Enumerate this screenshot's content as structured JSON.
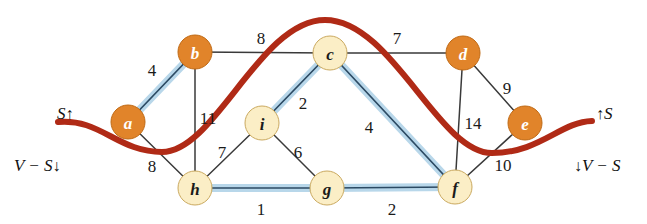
{
  "figure": {
    "width": 647,
    "height": 224,
    "background": "#ffffff"
  },
  "colors": {
    "node_dark_fill": "#e1842a",
    "node_light_fill": "#fbeec6",
    "cut_curve": "#b02a16",
    "mst_highlight": "#b8d7ea",
    "edge_stroke": "#3a3a3a"
  },
  "labels": {
    "left_top": {
      "set": "S",
      "arrow": "↑"
    },
    "left_bottom": {
      "set": "V − S",
      "arrow": "↓"
    },
    "right_top": {
      "arrow": "↑",
      "set": "S"
    },
    "right_bottom": {
      "arrow": "↓",
      "set": "V − S"
    }
  },
  "chart_data": {
    "type": "diagram",
    "title": "",
    "nodes": [
      {
        "id": "a",
        "label": "a",
        "x": 128,
        "y": 122,
        "r": 17,
        "side": "S",
        "shade": "dark"
      },
      {
        "id": "b",
        "label": "b",
        "x": 195,
        "y": 52,
        "r": 17,
        "side": "S",
        "shade": "dark"
      },
      {
        "id": "c",
        "label": "c",
        "x": 330,
        "y": 53,
        "r": 17,
        "side": "V-S",
        "shade": "light"
      },
      {
        "id": "d",
        "label": "d",
        "x": 463,
        "y": 53,
        "r": 17,
        "side": "S",
        "shade": "dark"
      },
      {
        "id": "e",
        "label": "e",
        "x": 525,
        "y": 123,
        "r": 17,
        "side": "S",
        "shade": "dark"
      },
      {
        "id": "f",
        "label": "f",
        "x": 455,
        "y": 187,
        "r": 17,
        "side": "V-S",
        "shade": "light"
      },
      {
        "id": "g",
        "label": "g",
        "x": 327,
        "y": 188,
        "r": 17,
        "side": "V-S",
        "shade": "light"
      },
      {
        "id": "h",
        "label": "h",
        "x": 195,
        "y": 188,
        "r": 17,
        "side": "V-S",
        "shade": "light"
      },
      {
        "id": "i",
        "label": "i",
        "x": 262,
        "y": 123,
        "r": 17,
        "side": "V-S",
        "shade": "light"
      }
    ],
    "edges": [
      {
        "from": "a",
        "to": "b",
        "weight": 4,
        "highlighted": true,
        "label_x": 152,
        "label_y": 70
      },
      {
        "from": "b",
        "to": "c",
        "weight": 8,
        "highlighted": false,
        "label_x": 261,
        "label_y": 38
      },
      {
        "from": "c",
        "to": "d",
        "weight": 7,
        "highlighted": false,
        "label_x": 397,
        "label_y": 38
      },
      {
        "from": "d",
        "to": "e",
        "weight": 9,
        "highlighted": false,
        "label_x": 507,
        "label_y": 88
      },
      {
        "from": "a",
        "to": "h",
        "weight": 8,
        "highlighted": false,
        "label_x": 152,
        "label_y": 166
      },
      {
        "from": "b",
        "to": "h",
        "weight": 11,
        "highlighted": false,
        "label_x": 208,
        "label_y": 118
      },
      {
        "from": "h",
        "to": "i",
        "weight": 7,
        "highlighted": false,
        "label_x": 222,
        "label_y": 152
      },
      {
        "from": "i",
        "to": "c",
        "weight": 2,
        "highlighted": true,
        "label_x": 303,
        "label_y": 103
      },
      {
        "from": "i",
        "to": "g",
        "weight": 6,
        "highlighted": false,
        "label_x": 298,
        "label_y": 152
      },
      {
        "from": "c",
        "to": "f",
        "weight": 4,
        "highlighted": true,
        "label_x": 369,
        "label_y": 127
      },
      {
        "from": "d",
        "to": "f",
        "weight": 14,
        "highlighted": false,
        "label_x": 473,
        "label_y": 123
      },
      {
        "from": "e",
        "to": "f",
        "weight": 10,
        "highlighted": false,
        "label_x": 503,
        "label_y": 165
      },
      {
        "from": "h",
        "to": "g",
        "weight": 1,
        "highlighted": true,
        "label_x": 261,
        "label_y": 209
      },
      {
        "from": "g",
        "to": "f",
        "weight": 2,
        "highlighted": true,
        "label_x": 392,
        "label_y": 209
      }
    ],
    "cut_curve_path": "M 58,122 C 100,118 118,152 162,152 C 215,152 260,20 325,20 C 392,20 438,153 492,153 C 540,153 560,122 592,121"
  }
}
